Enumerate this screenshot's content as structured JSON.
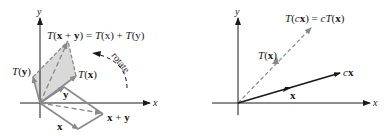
{
  "left_panel": {
    "axis_x_label": "x",
    "axis_y_label": "y",
    "title": {
      "T": "T",
      "open": "(",
      "x": "x",
      "plus": " + ",
      "y": "y",
      "close": ")",
      "eq": " = ",
      "T2": "T",
      "x2": "(x)",
      "plus2": " + ",
      "T3": "T",
      "y3": "(y)"
    },
    "label_Ty": {
      "T": "T",
      "open": "(",
      "v": "y",
      "close": ")"
    },
    "label_Tx": {
      "T": "T",
      "open": "(",
      "v": "x",
      "close": ")"
    },
    "label_x": "x",
    "label_y": "y",
    "label_xy": {
      "x": "x",
      "plus": " + ",
      "y": "y"
    },
    "rotate_label": "rotate"
  },
  "right_panel": {
    "axis_x_label": "x",
    "axis_y_label": "y",
    "title": {
      "T": "T",
      "open": "(",
      "c": "c",
      "x": "x",
      "close": ")",
      "eq": " = ",
      "c2": "c",
      "T2": "T",
      "open2": "(",
      "x2": "x",
      "close2": ")"
    },
    "label_Tx": {
      "T": "T",
      "open": "(",
      "v": "x",
      "close": ")"
    },
    "label_cx": {
      "c": "c",
      "x": "x"
    },
    "label_x": "x"
  },
  "colors": {
    "axis": "#1a1a1a",
    "vector_gray": "#8a8a8a",
    "shade": "#d9d9d9",
    "dark_vector": "#1a1a1a"
  }
}
